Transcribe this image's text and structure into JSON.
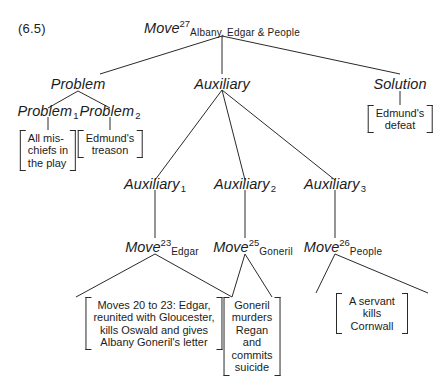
{
  "figure": {
    "number": "(6.5)",
    "ink_color": "#1c1c1c"
  },
  "tree": {
    "root": {
      "name": "Move",
      "superscript": "27",
      "subscript": "Albany, Edgar & People"
    },
    "level2": {
      "problem": "Problem",
      "auxiliary": "Auxiliary",
      "solution": "Solution"
    },
    "problems": {
      "p1": {
        "name": "Problem",
        "index": "1"
      },
      "p2": {
        "name": "Problem",
        "index": "2"
      }
    },
    "auxiliaries": {
      "a1": {
        "name": "Auxiliary",
        "index": "1"
      },
      "a2": {
        "name": "Auxiliary",
        "index": "2"
      },
      "a3": {
        "name": "Auxiliary",
        "index": "3"
      }
    },
    "moves": {
      "m23": {
        "name": "Move",
        "superscript": "23",
        "subscript": "Edgar"
      },
      "m25": {
        "name": "Move",
        "superscript": "25",
        "subscript": "Goneril"
      },
      "m26": {
        "name": "Move",
        "superscript": "26",
        "subscript": "People"
      }
    },
    "leaves": {
      "p1_text": "All mis-\nchiefs in\nthe play",
      "p2_text": "Edmund's\ntreason",
      "solution_text": "Edmund's\ndefeat",
      "m23_text": "Moves 20 to 23:  Edgar,\nreunited with Gloucester,\nkills Oswald and gives\nAlbany Goneril's letter",
      "m25_text": "Goneril\nmurders\nRegan\nand\ncommits\nsuicide",
      "m26_text": "A servant kills\nCornwall"
    }
  }
}
